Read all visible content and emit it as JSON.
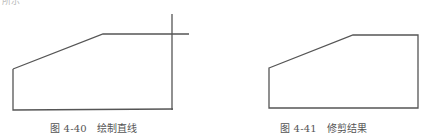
{
  "header_fragment": "所示",
  "figures": [
    {
      "id": "fig-4-40",
      "caption_number": "图 4-40",
      "caption_title": "绘制直线",
      "polyline": [
        [
          13,
          69
        ],
        [
          103,
          34
        ],
        [
          189,
          34
        ]
      ],
      "outline": [
        [
          13,
          69
        ],
        [
          13,
          110
        ],
        [
          173,
          109
        ]
      ],
      "vertical_line": [
        [
          172,
          14
        ],
        [
          172,
          110
        ]
      ]
    },
    {
      "id": "fig-4-41",
      "caption_number": "图 4-41",
      "caption_title": "修剪结果",
      "polygon": [
        [
          269,
          68
        ],
        [
          353,
          35
        ],
        [
          418,
          35
        ],
        [
          418,
          108
        ],
        [
          269,
          108
        ]
      ]
    }
  ],
  "colors": {
    "line": "#555555",
    "caption": "#555555"
  }
}
